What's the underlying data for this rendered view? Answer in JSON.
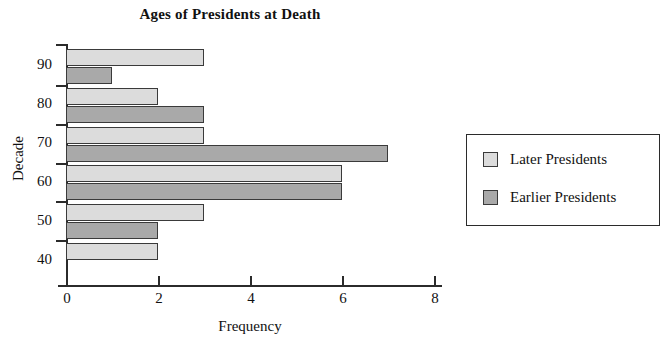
{
  "chart_data": {
    "type": "bar",
    "orientation": "horizontal",
    "title": "Ages of Presidents at Death",
    "xlabel": "Frequency",
    "ylabel": "Decade",
    "categories": [
      "90",
      "80",
      "70",
      "60",
      "50",
      "40"
    ],
    "series": [
      {
        "name": "Later Presidents",
        "color": "#dcdcdc",
        "values": [
          3,
          2,
          3,
          6,
          3,
          2
        ]
      },
      {
        "name": "Earlier Presidents",
        "color": "#a9a9a9",
        "values": [
          1,
          3,
          7,
          6,
          2,
          0
        ]
      }
    ],
    "xlim": [
      0,
      8
    ],
    "xticks": [
      "0",
      "2",
      "4",
      "6",
      "8"
    ],
    "xtick_values": [
      0,
      2,
      4,
      6,
      8
    ],
    "grid": false,
    "legend_position": "right"
  },
  "legend": {
    "entries": [
      {
        "label": "Later Presidents"
      },
      {
        "label": "Earlier Presidents"
      }
    ]
  }
}
